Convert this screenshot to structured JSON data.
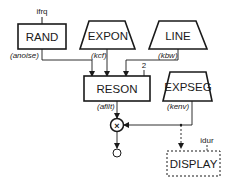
{
  "diagram": {
    "type": "signal-flow",
    "nodes": {
      "rand": {
        "label": "RAND",
        "shape": "rectangle",
        "output": "(anoise)",
        "input": "ifrq"
      },
      "expon": {
        "label": "EXPON",
        "shape": "trapezoid",
        "output": "(kcf)"
      },
      "line": {
        "label": "LINE",
        "shape": "trapezoid",
        "output": "(kbw)"
      },
      "reson": {
        "label": "RESON",
        "shape": "rectangle",
        "output": "(afilt)",
        "param": "2"
      },
      "expseg": {
        "label": "EXPSEG",
        "shape": "trapezoid",
        "output": "(kenv)"
      },
      "multiply": {
        "symbol": "×",
        "shape": "circle"
      },
      "output": {
        "shape": "circle"
      },
      "display": {
        "label": "DISPLAY",
        "shape": "dashed-rectangle",
        "input": "idur"
      }
    },
    "edges": [
      {
        "from": "rand",
        "to": "reson",
        "style": "solid"
      },
      {
        "from": "expon",
        "to": "reson",
        "style": "solid"
      },
      {
        "from": "line",
        "to": "reson",
        "style": "solid"
      },
      {
        "from": "reson",
        "to": "multiply",
        "style": "solid"
      },
      {
        "from": "expseg",
        "to": "multiply",
        "style": "solid"
      },
      {
        "from": "expseg",
        "to": "display",
        "style": "dashed"
      },
      {
        "from": "multiply",
        "to": "output",
        "style": "solid"
      }
    ]
  }
}
